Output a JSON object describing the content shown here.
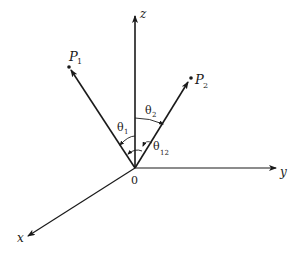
{
  "diagram": {
    "type": "3d-coordinate-vectors",
    "origin_label": "0",
    "axes": [
      {
        "name": "z",
        "label": "z"
      },
      {
        "name": "y",
        "label": "y"
      },
      {
        "name": "x",
        "label": "x"
      }
    ],
    "points": [
      {
        "name": "P1",
        "label": "P",
        "subscript": "1"
      },
      {
        "name": "P2",
        "label": "P",
        "subscript": "2"
      }
    ],
    "angles": [
      {
        "name": "theta1",
        "label": "θ",
        "subscript": "1",
        "between": "z and OP1"
      },
      {
        "name": "theta2",
        "label": "θ",
        "subscript": "2",
        "between": "z and OP2"
      },
      {
        "name": "theta12",
        "label": "θ",
        "subscript": "12",
        "between": "OP1 and OP2"
      }
    ],
    "line_color": "#1a1a1a"
  }
}
